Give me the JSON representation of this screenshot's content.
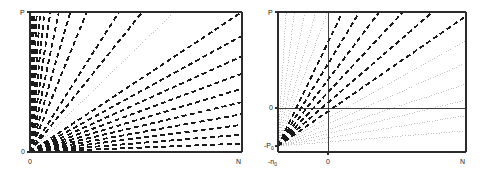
{
  "figure": {
    "background": "#ffffff",
    "colors": {
      "frame": "#2b2b2b",
      "dark_line": "#1a1a1a",
      "light_line": "#b4b4b4",
      "text": "#1a1a1a"
    }
  },
  "panels": [
    {
      "id": "left-panel",
      "name": "left-panel",
      "plot_box": {
        "x": 30,
        "y": 12,
        "width": 212,
        "height": 140
      },
      "origin": {
        "x": 30,
        "y": 152
      },
      "axes": {
        "y_axis_label": "P",
        "y_axis_label_pos": {
          "x": 20,
          "y": 9
        },
        "y_tick_label": "0",
        "y_tick_label_pos": {
          "x": 21,
          "y": 148
        },
        "x_axis_origin_label": "0",
        "x_axis_origin_label_pos": {
          "x": 28,
          "y": 158
        },
        "x_axis_end_label": "N",
        "x_axis_end_label_pos": {
          "x": 236,
          "y": 158
        }
      },
      "chart_data": {
        "type": "line",
        "title": "",
        "xlabel": "N",
        "ylabel": "P",
        "xlim": [
          0,
          1
        ],
        "ylim": [
          0,
          1
        ],
        "grid": false,
        "legend": "none",
        "description": "Fan of straight lines all emanating from the origin (0,0); dashed heavy black rays plus one thin light-gray reference ray of unit slope.",
        "series": [
          {
            "name": "dark-ray-01",
            "style": "dashed",
            "color": "#1a1a1a",
            "slope_ratio": 0.03
          },
          {
            "name": "dark-ray-02",
            "style": "dashed",
            "color": "#1a1a1a",
            "slope_ratio": 0.062
          },
          {
            "name": "dark-ray-03",
            "style": "dashed",
            "color": "#1a1a1a",
            "slope_ratio": 0.097
          },
          {
            "name": "dark-ray-04",
            "style": "dashed",
            "color": "#1a1a1a",
            "slope_ratio": 0.135
          },
          {
            "name": "dark-ray-05",
            "style": "dashed",
            "color": "#1a1a1a",
            "slope_ratio": 0.178
          },
          {
            "name": "dark-ray-06",
            "style": "dashed",
            "color": "#1a1a1a",
            "slope_ratio": 0.226
          },
          {
            "name": "dark-ray-07",
            "style": "dashed",
            "color": "#1a1a1a",
            "slope_ratio": 0.28
          },
          {
            "name": "dark-ray-08",
            "style": "dashed",
            "color": "#1a1a1a",
            "slope_ratio": 0.342
          },
          {
            "name": "dark-ray-09",
            "style": "dashed",
            "color": "#1a1a1a",
            "slope_ratio": 0.415
          },
          {
            "name": "dark-ray-10",
            "style": "dashed",
            "color": "#1a1a1a",
            "slope_ratio": 0.5
          },
          {
            "name": "reference-ray",
            "style": "dotted",
            "color": "#b4b4b4",
            "slope_ratio": 0.66
          },
          {
            "name": "dark-ray-11",
            "style": "dashed",
            "color": "#1a1a1a",
            "slope_ratio": 0.735
          },
          {
            "name": "dark-ray-12",
            "style": "dashed",
            "color": "#1a1a1a",
            "slope_ratio": 0.79
          },
          {
            "name": "dark-ray-13",
            "style": "dashed",
            "color": "#1a1a1a",
            "slope_ratio": 0.866
          },
          {
            "name": "dark-ray-14",
            "style": "dashed",
            "color": "#1a1a1a",
            "slope_ratio": 0.905
          },
          {
            "name": "dark-ray-15",
            "style": "dashed",
            "color": "#1a1a1a",
            "slope_ratio": 0.932
          },
          {
            "name": "dark-ray-16",
            "style": "dashed",
            "color": "#1a1a1a",
            "slope_ratio": 0.952
          },
          {
            "name": "dark-ray-17",
            "style": "dashed",
            "color": "#1a1a1a",
            "slope_ratio": 0.966
          },
          {
            "name": "dark-ray-18",
            "style": "dashed",
            "color": "#1a1a1a",
            "slope_ratio": 0.976
          },
          {
            "name": "dark-ray-19",
            "style": "dashed",
            "color": "#1a1a1a",
            "slope_ratio": 0.984
          },
          {
            "name": "dark-ray-20",
            "style": "dashed",
            "color": "#1a1a1a",
            "slope_ratio": 0.99
          },
          {
            "name": "dark-ray-21",
            "style": "dashed",
            "color": "#1a1a1a",
            "slope_ratio": 0.995
          }
        ]
      }
    },
    {
      "id": "right-panel",
      "name": "right-panel",
      "plot_box": {
        "x": 278,
        "y": 12,
        "width": 188,
        "height": 140
      },
      "origin": {
        "x": 278,
        "y": 146
      },
      "axes": {
        "y_axis_label": "P",
        "y_axis_label_pos": {
          "x": 268,
          "y": 9
        },
        "y_tick_label": "0",
        "y_tick_label_pos": {
          "x": 269,
          "y": 104
        },
        "y_bottom_label": "-P",
        "y_bottom_label_sub": "0",
        "y_bottom_label_pos": {
          "x": 264,
          "y": 142
        },
        "x_left_label": "-n",
        "x_left_label_sub": "0",
        "x_left_label_pos": {
          "x": 268,
          "y": 158
        },
        "x_axis_origin_label": "0",
        "x_axis_origin_label_pos": {
          "x": 326,
          "y": 158
        },
        "x_axis_end_label": "N",
        "x_axis_end_label_pos": {
          "x": 460,
          "y": 158
        }
      },
      "reference_lines": {
        "vertical_zero_x": 328,
        "horizontal_zero_y": 108
      },
      "chart_data": {
        "type": "line",
        "title": "",
        "xlabel": "N",
        "ylabel": "P",
        "xlim": [
          -0.35,
          1
        ],
        "ylim": [
          -0.28,
          1
        ],
        "grid": false,
        "legend": "none",
        "description": "Same fan of rays re-plotted in shifted coordinates so that all lines emanate from the point (-n0, -P0) at the lower-left corner; rays crossing into the positive quadrant are heavy dashed black, the remainder are light gray dotted.",
        "series": [
          {
            "name": "light-ray-01",
            "style": "dotted",
            "color": "#b4b4b4",
            "angle_deg": 4
          },
          {
            "name": "light-ray-02",
            "style": "dotted",
            "color": "#b4b4b4",
            "angle_deg": 8
          },
          {
            "name": "light-ray-03",
            "style": "dotted",
            "color": "#b4b4b4",
            "angle_deg": 12
          },
          {
            "name": "light-ray-04",
            "style": "dotted",
            "color": "#b4b4b4",
            "angle_deg": 16
          },
          {
            "name": "light-ray-05",
            "style": "dotted",
            "color": "#b4b4b4",
            "angle_deg": 21
          },
          {
            "name": "light-ray-06",
            "style": "dotted",
            "color": "#b4b4b4",
            "angle_deg": 26
          },
          {
            "name": "dark-ray-01",
            "style": "dashed",
            "color": "#1a1a1a",
            "angle_deg": 31
          },
          {
            "name": "dark-ray-02",
            "style": "dashed",
            "color": "#1a1a1a",
            "angle_deg": 37
          },
          {
            "name": "dark-ray-03",
            "style": "dashed",
            "color": "#1a1a1a",
            "angle_deg": 43
          },
          {
            "name": "dark-ray-04",
            "style": "dashed",
            "color": "#1a1a1a",
            "angle_deg": 49
          },
          {
            "name": "dark-ray-05",
            "style": "dashed",
            "color": "#1a1a1a",
            "angle_deg": 55
          },
          {
            "name": "dark-ray-06",
            "style": "dashed",
            "color": "#1a1a1a",
            "angle_deg": 61
          },
          {
            "name": "light-ray-07",
            "style": "dotted",
            "color": "#b4b4b4",
            "angle_deg": 67
          },
          {
            "name": "light-ray-08",
            "style": "dotted",
            "color": "#b4b4b4",
            "angle_deg": 72
          },
          {
            "name": "light-ray-09",
            "style": "dotted",
            "color": "#b4b4b4",
            "angle_deg": 77
          },
          {
            "name": "light-ray-10",
            "style": "dotted",
            "color": "#b4b4b4",
            "angle_deg": 82
          },
          {
            "name": "light-ray-11",
            "style": "dotted",
            "color": "#b4b4b4",
            "angle_deg": 86
          }
        ]
      }
    }
  ]
}
